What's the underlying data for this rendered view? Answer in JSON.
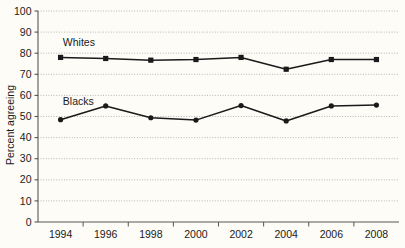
{
  "chart_data": {
    "type": "line",
    "title": "",
    "subtitle": "",
    "xlabel": "",
    "ylabel": "Percent agreeing",
    "xlim": [
      1993,
      2009
    ],
    "ylim": [
      0,
      100
    ],
    "ytick_step": 10,
    "yticks": [
      0,
      10,
      20,
      30,
      40,
      50,
      60,
      70,
      80,
      90,
      100
    ],
    "xticks": [
      1994,
      1996,
      1998,
      2000,
      2002,
      2004,
      2006,
      2008
    ],
    "xtick_labels": [
      "1994",
      "1996",
      "1998",
      "2000",
      "2002",
      "2004",
      "2006",
      "2008"
    ],
    "grid": "horizontal-dotted",
    "legend_position": "inline-labels",
    "x": [
      1994,
      1996,
      1998,
      2000,
      2002,
      2004,
      2006,
      2008
    ],
    "series": [
      {
        "name": "Whites",
        "label": "Whites",
        "color": "#1a1a1a",
        "marker": "square",
        "label_x": 1994.1,
        "label_y": 83.5,
        "values": [
          78.0,
          77.5,
          76.7,
          77.0,
          78.0,
          72.4,
          77.0,
          77.0
        ]
      },
      {
        "name": "Blacks",
        "label": "Blacks",
        "color": "#1a1a1a",
        "marker": "circle",
        "label_x": 1994.1,
        "label_y": 55.5,
        "values": [
          48.5,
          55.0,
          49.4,
          48.3,
          55.2,
          47.9,
          55.0,
          55.4
        ]
      }
    ]
  }
}
